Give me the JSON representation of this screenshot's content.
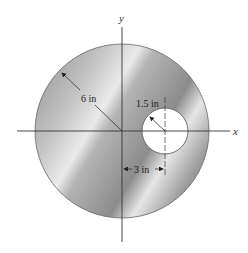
{
  "diagram": {
    "type": "circular plate with off-center hole",
    "axes": {
      "x_label": "x",
      "y_label": "y"
    },
    "outer_circle": {
      "radius_label": "6 in"
    },
    "hole": {
      "radius_label": "1.5 in",
      "offset_label": "3 in"
    },
    "colors": {
      "plate_dark": "#8a8a8a",
      "plate_light": "#f0f0f0",
      "line": "#333333",
      "hole_fill": "#ffffff"
    }
  }
}
